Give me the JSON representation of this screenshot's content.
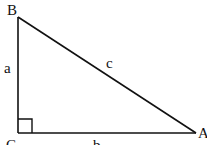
{
  "diagram": {
    "type": "right-triangle",
    "stroke_color": "#111111",
    "background": "#ffffff",
    "vertices": [
      {
        "id": "B",
        "label": "B",
        "x": 18,
        "y": 17
      },
      {
        "id": "C",
        "label": "C",
        "x": 18,
        "y": 133
      },
      {
        "id": "A",
        "label": "A",
        "x": 196,
        "y": 133
      }
    ],
    "sides": [
      {
        "id": "a",
        "label": "a",
        "from": "B",
        "to": "C"
      },
      {
        "id": "b",
        "label": "b",
        "from": "C",
        "to": "A"
      },
      {
        "id": "c",
        "label": "c",
        "from": "B",
        "to": "A"
      }
    ],
    "right_angle_at": "C",
    "right_angle_marker_size": 14
  }
}
